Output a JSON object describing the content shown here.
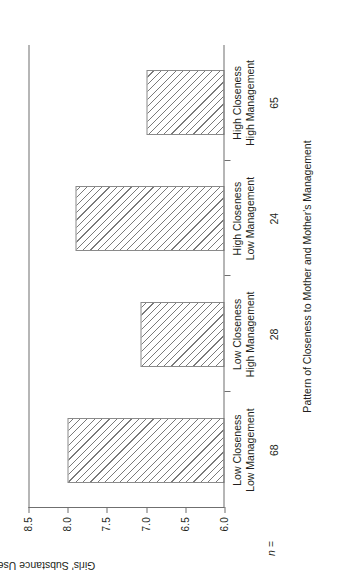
{
  "chart_data": {
    "type": "bar",
    "title": "",
    "orientation": "vertical",
    "xlabel": "Pattern of Closeness to Mother and Mother's Management",
    "ylabel": "Girls' Substance Use",
    "ylim": [
      6.0,
      8.5
    ],
    "ytick_labels": [
      "6.0",
      "6.5",
      "7.0",
      "7.5",
      "8.0",
      "8.5"
    ],
    "ytick_values": [
      6.0,
      6.5,
      7.0,
      7.5,
      8.0,
      8.5
    ],
    "grid": false,
    "legend": false,
    "categories": [
      "Low Closeness\nLow Management",
      "Low Closeness\nHigh Management",
      "High Closeness\nLow Management",
      "High Closeness\nHigh Management"
    ],
    "category_lines": [
      [
        "Low Closeness",
        "Low Management"
      ],
      [
        "Low Closeness",
        "High Management"
      ],
      [
        "High Closeness",
        "Low Management"
      ],
      [
        "High Closeness",
        "High Management"
      ]
    ],
    "values": [
      8.0,
      7.07,
      7.9,
      7.0
    ],
    "n_label": "n =",
    "n_values": [
      "68",
      "28",
      "24",
      "65"
    ],
    "bar_fill": "diagonal-hatch",
    "bar_edge_color": "#8a8a8a",
    "axis_color": "#6f6f6f",
    "text_color": "#231f20",
    "background": "#ffffff"
  }
}
